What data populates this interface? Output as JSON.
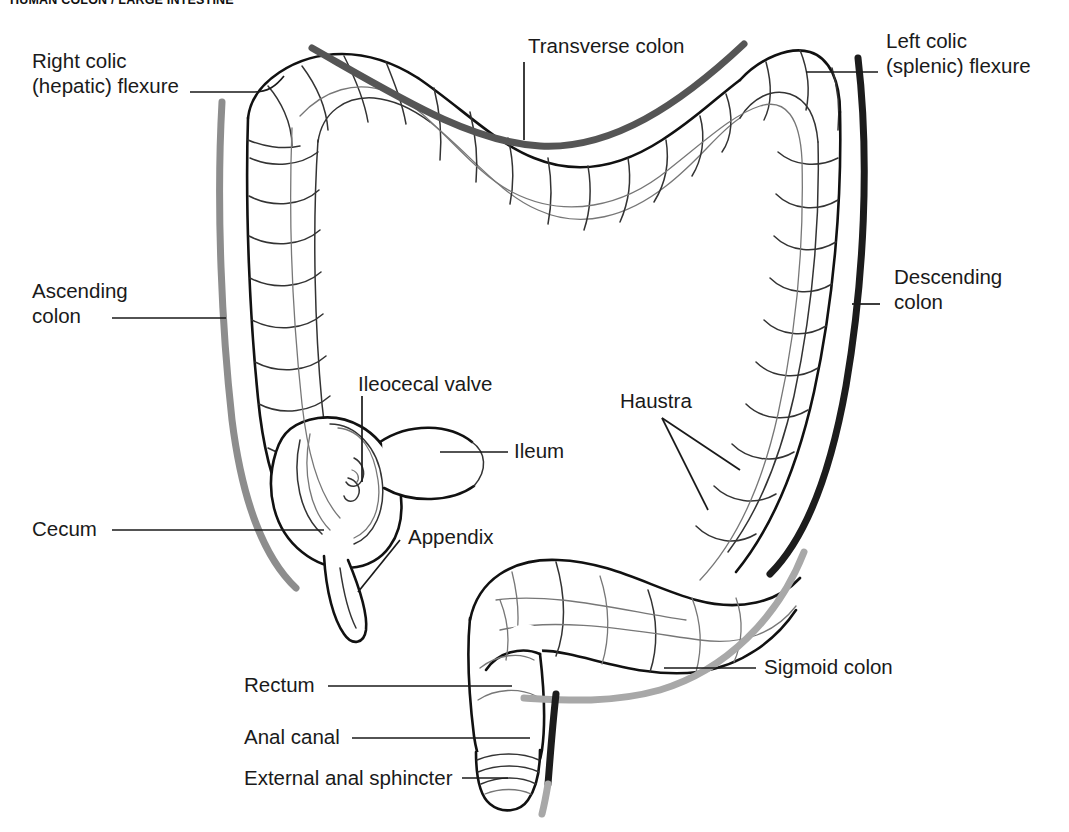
{
  "title": "HUMAN COLON / LARGE INTESTINE",
  "figure": {
    "type": "anatomical-diagram",
    "style": "line drawing, black outline on white",
    "highlight_colors": {
      "transverse_colon_band": "#555555",
      "descending_colon_band": "#1c1c1c",
      "ascending_colon_band": "#8a8a8a",
      "sigmoid_colon_band": "#9a9a9a",
      "anal_canal_band": "#222222",
      "outline": "#111111"
    }
  },
  "labels": [
    {
      "id": "right-colic-flexure",
      "text": "Right colic\n(hepatic) flexure"
    },
    {
      "id": "transverse-colon",
      "text": "Transverse colon"
    },
    {
      "id": "left-colic-flexure",
      "text": "Left colic\n(splenic) flexure"
    },
    {
      "id": "ascending-colon",
      "text": "Ascending\ncolon"
    },
    {
      "id": "descending-colon",
      "text": "Descending\ncolon"
    },
    {
      "id": "ileocecal-valve",
      "text": "Ileocecal valve"
    },
    {
      "id": "ileum",
      "text": "Ileum"
    },
    {
      "id": "haustra",
      "text": "Haustra"
    },
    {
      "id": "cecum",
      "text": "Cecum"
    },
    {
      "id": "appendix",
      "text": "Appendix"
    },
    {
      "id": "sigmoid-colon",
      "text": "Sigmoid colon"
    },
    {
      "id": "rectum",
      "text": "Rectum"
    },
    {
      "id": "anal-canal",
      "text": "Anal canal"
    },
    {
      "id": "external-anal-sphincter",
      "text": "External anal sphincter"
    }
  ],
  "label_text": {
    "right_colic_line1": "Right colic",
    "right_colic_line2": "(hepatic) flexure",
    "transverse_colon": "Transverse colon",
    "left_colic_line1": "Left colic",
    "left_colic_line2": "(splenic) flexure",
    "ascending_line1": "Ascending",
    "ascending_line2": "colon",
    "descending_line1": "Descending",
    "descending_line2": "colon",
    "ileocecal_valve": "Ileocecal valve",
    "ileum": "Ileum",
    "haustra": "Haustra",
    "cecum": "Cecum",
    "appendix": "Appendix",
    "sigmoid_colon": "Sigmoid colon",
    "rectum": "Rectum",
    "anal_canal": "Anal canal",
    "external_anal_sphincter": "External anal sphincter"
  }
}
